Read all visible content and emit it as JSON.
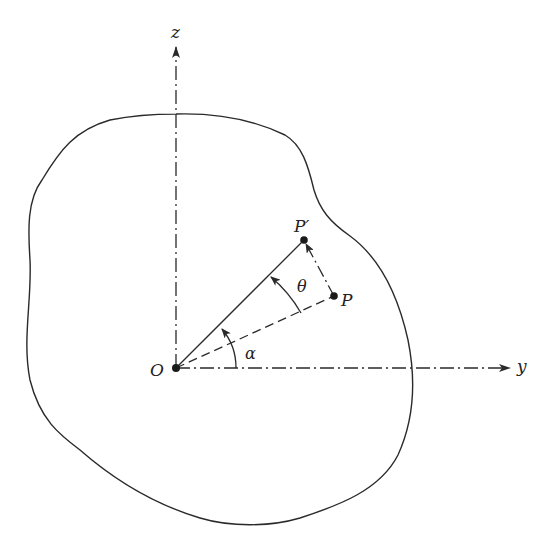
{
  "diagram": {
    "colors": {
      "stroke": "#2a2a2a",
      "background": "#ffffff"
    },
    "axes": {
      "z": {
        "label": "z",
        "style": "dash-dot",
        "arrow": true
      },
      "y": {
        "label": "y",
        "style": "dash-dot",
        "arrow": true
      }
    },
    "points": {
      "origin": {
        "label": "O"
      },
      "p": {
        "label": "P"
      },
      "p_prime": {
        "label": "P′"
      }
    },
    "angles": {
      "alpha": {
        "label": "α",
        "from": "y-axis",
        "to": "OP"
      },
      "theta": {
        "label": "θ",
        "from": "OP",
        "to": "OP′"
      }
    },
    "segments": [
      {
        "from": "O",
        "to": "P",
        "style": "dashed"
      },
      {
        "from": "O",
        "to": "P′",
        "style": "solid"
      },
      {
        "from": "P",
        "to": "P′",
        "style": "dash-dot",
        "arrow": true
      }
    ],
    "body_outline": "closed irregular curve (rigid body)"
  }
}
